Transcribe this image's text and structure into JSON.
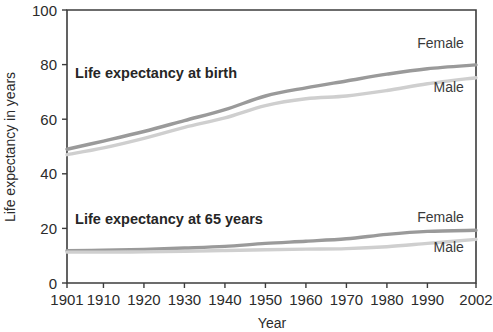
{
  "chart_data": {
    "type": "line",
    "title": "",
    "xlabel": "Year",
    "ylabel": "Life expectancy in years",
    "grid": false,
    "legend_position": "inline-right-of-line-ends",
    "xlim": [
      1901,
      2002
    ],
    "ylim": [
      0,
      100
    ],
    "ytick_labels": [
      "0",
      "20",
      "40",
      "60",
      "80",
      "100"
    ],
    "ytick_values": [
      0,
      20,
      40,
      60,
      80,
      100
    ],
    "xtick_labels": [
      "1901",
      "1910",
      "1920",
      "1930",
      "1940",
      "1950",
      "1960",
      "1970",
      "1980",
      "1990",
      "2002"
    ],
    "xtick_values": [
      1901,
      1910,
      1920,
      1930,
      1940,
      1950,
      1960,
      1970,
      1980,
      1990,
      2002
    ],
    "annotations": [
      {
        "text": "Life expectancy at birth",
        "x": 1903,
        "y": 75
      },
      {
        "text": "Life expectancy at 65 years",
        "x": 1903,
        "y": 21.5
      }
    ],
    "colors": {
      "female": "#9a9a9a",
      "male": "#cfcfcf",
      "axis": "#3c3c3c",
      "text": "#2b2b2b"
    },
    "groups": [
      {
        "name": "Life expectancy at birth",
        "series": [
          {
            "name": "Female",
            "color": "#9a9a9a",
            "label_x": 1999,
            "label_y": 86,
            "x": [
              1901,
              1910,
              1920,
              1930,
              1940,
              1950,
              1960,
              1970,
              1980,
              1990,
              2002
            ],
            "values": [
              49.0,
              52.0,
              55.5,
              59.5,
              63.5,
              68.5,
              71.5,
              74.0,
              76.5,
              78.5,
              79.9
            ]
          },
          {
            "name": "Male",
            "color": "#cfcfcf",
            "label_x": 1999,
            "label_y": 70,
            "x": [
              1901,
              1910,
              1920,
              1930,
              1940,
              1950,
              1960,
              1970,
              1980,
              1990,
              2002
            ],
            "values": [
              47.0,
              49.5,
              53.0,
              57.0,
              60.5,
              65.0,
              67.5,
              68.5,
              70.5,
              73.0,
              75.2
            ]
          }
        ]
      },
      {
        "name": "Life expectancy at 65 years",
        "series": [
          {
            "name": "Female",
            "color": "#9a9a9a",
            "label_x": 1999,
            "label_y": 22.5,
            "x": [
              1901,
              1910,
              1920,
              1930,
              1940,
              1950,
              1960,
              1970,
              1980,
              1990,
              2002
            ],
            "values": [
              11.8,
              12.0,
              12.3,
              12.8,
              13.4,
              14.5,
              15.3,
              16.2,
              17.8,
              18.9,
              19.3
            ]
          },
          {
            "name": "Male",
            "color": "#cfcfcf",
            "label_x": 1999,
            "label_y": 11.5,
            "x": [
              1901,
              1910,
              1920,
              1930,
              1940,
              1950,
              1960,
              1970,
              1980,
              1990,
              2002
            ],
            "values": [
              11.3,
              11.3,
              11.4,
              11.6,
              11.9,
              12.2,
              12.4,
              12.6,
              13.3,
              14.5,
              16.0
            ]
          }
        ]
      }
    ]
  }
}
